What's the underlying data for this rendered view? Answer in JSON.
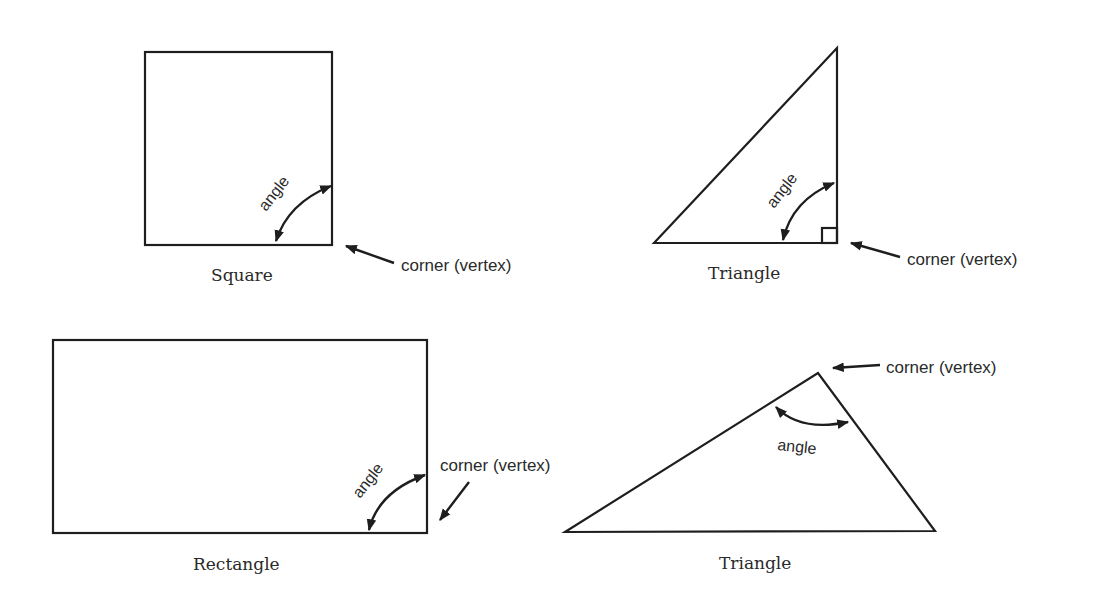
{
  "diagram": {
    "shapes": [
      {
        "id": "square",
        "name": "Square",
        "angle_label": "angle",
        "corner_label": "corner (vertex)"
      },
      {
        "id": "right-triangle",
        "name": "Triangle",
        "angle_label": "angle",
        "corner_label": "corner (vertex)"
      },
      {
        "id": "rectangle",
        "name": "Rectangle",
        "angle_label": "angle",
        "corner_label": "corner (vertex)"
      },
      {
        "id": "obtuse-triangle",
        "name": "Triangle",
        "angle_label": "angle",
        "corner_label": "corner (vertex)"
      }
    ],
    "colors": {
      "stroke": "#1e1e1e",
      "text": "#2a2a2a",
      "background": "#ffffff"
    }
  }
}
